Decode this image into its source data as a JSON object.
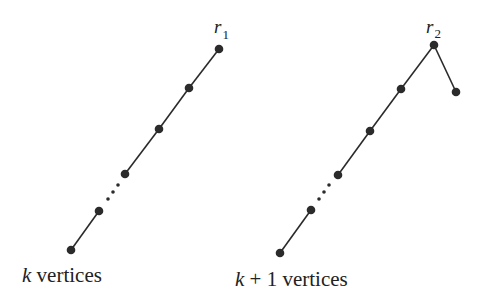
{
  "figure": {
    "left_tree": {
      "root_label": "r",
      "root_subscript": "1",
      "caption_var": "k",
      "caption_text": " vertices",
      "vertices": [
        {
          "x": 71,
          "y": 250
        },
        {
          "x": 99,
          "y": 211
        },
        {
          "x": 125,
          "y": 174
        },
        {
          "x": 159,
          "y": 129
        },
        {
          "x": 189,
          "y": 88
        },
        {
          "x": 219,
          "y": 49
        }
      ],
      "edges": [
        [
          0,
          1
        ],
        [
          2,
          3
        ],
        [
          3,
          4
        ],
        [
          4,
          5
        ]
      ],
      "ellipsis_dots": [
        {
          "x": 108,
          "y": 199
        },
        {
          "x": 113,
          "y": 192
        },
        {
          "x": 118,
          "y": 185
        }
      ]
    },
    "right_tree": {
      "root_label": "r",
      "root_subscript": "2",
      "caption_var": "k",
      "caption_text": " + 1 vertices",
      "vertices": [
        {
          "x": 280,
          "y": 253
        },
        {
          "x": 311,
          "y": 210
        },
        {
          "x": 338,
          "y": 175
        },
        {
          "x": 370,
          "y": 131
        },
        {
          "x": 401,
          "y": 89
        },
        {
          "x": 434,
          "y": 45
        },
        {
          "x": 456,
          "y": 92
        }
      ],
      "edges": [
        [
          0,
          1
        ],
        [
          2,
          3
        ],
        [
          3,
          4
        ],
        [
          4,
          5
        ],
        [
          5,
          6
        ]
      ],
      "ellipsis_dots": [
        {
          "x": 319,
          "y": 199
        },
        {
          "x": 324,
          "y": 192
        },
        {
          "x": 329,
          "y": 185
        }
      ]
    },
    "colors": {
      "ink": "#2b2b2b",
      "background": "#ffffff"
    }
  }
}
